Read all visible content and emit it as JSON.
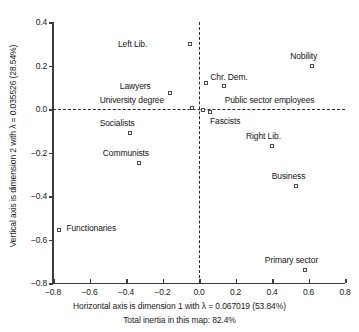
{
  "chart_data": {
    "type": "scatter",
    "title": "",
    "xlabel": "Horizontal axis is dimension 1 with λ = 0.067019 (53.84%)",
    "ylabel": "Vertical axis is dimension 2 with λ = 0.035526 (28.54%)",
    "caption": "Total inertia in this map: 82.4%",
    "xlim": [
      -0.8,
      0.8
    ],
    "ylim": [
      -0.8,
      0.4
    ],
    "xticks": [
      "-0.8",
      "-0.6",
      "-0.4",
      "-0.2",
      "0.0",
      "0.2",
      "0.4",
      "0.6",
      "0.8"
    ],
    "xtick_values": [
      -0.8,
      -0.6,
      -0.4,
      -0.2,
      0.0,
      0.2,
      0.4,
      0.6,
      0.8
    ],
    "yticks": [
      "0.4",
      "0.2",
      "0.0",
      "-0.2",
      "-0.4",
      "-0.6",
      "-0.8"
    ],
    "ytick_values": [
      0.4,
      0.2,
      0.0,
      -0.2,
      -0.4,
      -0.6,
      -0.8
    ],
    "grid": false,
    "legend": "none",
    "reference_lines": {
      "horizontal": 0.0,
      "vertical": 0.0,
      "style": "dashed"
    },
    "marker_style": "open-square",
    "points": [
      {
        "label": "Left Lib.",
        "x": -0.05,
        "y": 0.3,
        "label_dx": -72,
        "label_dy": -4
      },
      {
        "label": "Nobility",
        "x": 0.62,
        "y": 0.2,
        "label_dx": -22,
        "label_dy": -14
      },
      {
        "label": "Lawyers",
        "x": -0.16,
        "y": 0.075,
        "label_dx": -50,
        "label_dy": -11
      },
      {
        "label": "Chr. Dem.",
        "x": 0.04,
        "y": 0.12,
        "label_dx": 4,
        "label_dy": -10
      },
      {
        "label": "",
        "x": 0.135,
        "y": 0.105,
        "label_dx": 0,
        "label_dy": 0
      },
      {
        "label": "Public sector employees",
        "x": 0.02,
        "y": -0.005,
        "label_dx": 22,
        "label_dy": -14
      },
      {
        "label": "University degree",
        "x": -0.04,
        "y": 0.005,
        "label_dx": -92,
        "label_dy": -12
      },
      {
        "label": "Fascists",
        "x": 0.06,
        "y": -0.015,
        "label_dx": 0,
        "label_dy": 5
      },
      {
        "label": "Socialists",
        "x": -0.38,
        "y": -0.11,
        "label_dx": -30,
        "label_dy": -14
      },
      {
        "label": "Right Lib.",
        "x": 0.4,
        "y": -0.17,
        "label_dx": -26,
        "label_dy": -14
      },
      {
        "label": "Communists",
        "x": -0.33,
        "y": -0.25,
        "label_dx": -36,
        "label_dy": -14
      },
      {
        "label": "Business",
        "x": 0.53,
        "y": -0.355,
        "label_dx": -24,
        "label_dy": -14
      },
      {
        "label": "Functionaries",
        "x": -0.765,
        "y": -0.555,
        "label_dx": 7,
        "label_dy": -6
      },
      {
        "label": "Primary sector",
        "x": 0.58,
        "y": -0.74,
        "label_dx": -40,
        "label_dy": -14
      }
    ]
  }
}
